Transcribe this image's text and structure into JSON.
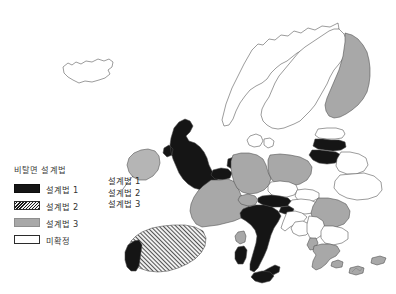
{
  "figure": {
    "kind": "choropleth-map",
    "region": "Europe",
    "background_color": "#ffffff"
  },
  "legend": {
    "title": "비탈면 설계법",
    "items": [
      {
        "label": "설계법 1",
        "swatch": "solid-black-swatch",
        "color": "#151515",
        "pattern": "solid"
      },
      {
        "label": "설계법 2",
        "swatch": "diagonal-hatch-swatch",
        "color": "#1b1b1b",
        "pattern": "diagonal-hatch"
      },
      {
        "label": "설계법 3",
        "swatch": "solid-gray-swatch",
        "color": "#a8a8a8",
        "pattern": "solid"
      },
      {
        "label": "미확정",
        "swatch": "empty-white-swatch",
        "color": "#ffffff",
        "pattern": "none"
      }
    ]
  },
  "annotations": {
    "callout_lines": [
      "설계법 1",
      "설계법 2",
      "설계법 3"
    ]
  },
  "map_data": {
    "palette": {
      "method1": "#151515",
      "method2_hatch": "#1b1b1b",
      "method3": "#a8a8a8",
      "undecided": "#ffffff",
      "border": "#4a4a4a"
    },
    "countries": [
      {
        "name": "Iceland",
        "category": "미확정"
      },
      {
        "name": "Norway",
        "category": "미확정"
      },
      {
        "name": "Sweden",
        "category": "미확정"
      },
      {
        "name": "Finland",
        "category": "설계법 3"
      },
      {
        "name": "Estonia",
        "category": "미확정"
      },
      {
        "name": "Latvia",
        "category": "설계법 1"
      },
      {
        "name": "Lithuania",
        "category": "설계법 1"
      },
      {
        "name": "Denmark",
        "category": "미확정"
      },
      {
        "name": "Ireland",
        "category": "설계법 3"
      },
      {
        "name": "United Kingdom",
        "category": "설계법 1"
      },
      {
        "name": "Netherlands",
        "category": "설계법 1"
      },
      {
        "name": "Belgium",
        "category": "설계법 1"
      },
      {
        "name": "France",
        "category": "설계법 3"
      },
      {
        "name": "Germany",
        "category": "설계법 3"
      },
      {
        "name": "Poland",
        "category": "설계법 3"
      },
      {
        "name": "Czech Republic",
        "category": "미확정"
      },
      {
        "name": "Slovakia",
        "category": "미확정"
      },
      {
        "name": "Austria",
        "category": "설계법 1"
      },
      {
        "name": "Switzerland",
        "category": "설계법 3"
      },
      {
        "name": "Hungary",
        "category": "미확정"
      },
      {
        "name": "Slovenia",
        "category": "설계법 1"
      },
      {
        "name": "Croatia",
        "category": "미확정"
      },
      {
        "name": "Bosnia",
        "category": "미확정"
      },
      {
        "name": "Serbia",
        "category": "미확정"
      },
      {
        "name": "Romania",
        "category": "설계법 3"
      },
      {
        "name": "Bulgaria",
        "category": "미확정"
      },
      {
        "name": "Albania",
        "category": "설계법 3"
      },
      {
        "name": "Greece",
        "category": "설계법 3"
      },
      {
        "name": "Italy",
        "category": "설계법 1"
      },
      {
        "name": "Sardinia",
        "category": "설계법 1"
      },
      {
        "name": "Corsica",
        "category": "설계법 3"
      },
      {
        "name": "Sicily",
        "category": "설계법 1"
      },
      {
        "name": "Spain",
        "category": "설계법 2"
      },
      {
        "name": "Portugal",
        "category": "설계법 1"
      },
      {
        "name": "Belarus",
        "category": "미확정"
      },
      {
        "name": "Ukraine",
        "category": "미확정"
      },
      {
        "name": "Cyprus",
        "category": "설계법 3"
      }
    ]
  }
}
